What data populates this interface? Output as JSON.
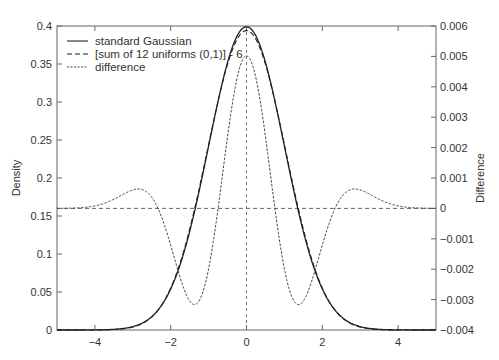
{
  "chart_data": {
    "type": "line",
    "title": "",
    "xlabel": "",
    "ylabel": "Density",
    "y2label": "Difference",
    "xlim": [
      -5,
      5
    ],
    "ylim": [
      0,
      0.4
    ],
    "y2lim": [
      -0.004,
      0.006
    ],
    "grid": false,
    "legend_position": "upper left",
    "x_ticks": [
      -4,
      -2,
      0,
      2,
      4
    ],
    "x_tick_labels": [
      "−4",
      "−2",
      "0",
      "2",
      "4"
    ],
    "y_ticks": [
      0,
      0.05,
      0.1,
      0.15,
      0.2,
      0.25,
      0.3,
      0.35,
      0.4
    ],
    "y_tick_labels": [
      "0",
      "0.05",
      "0.1",
      "0.15",
      "0.2",
      "0.25",
      "0.3",
      "0.35",
      "0.4"
    ],
    "y2_ticks": [
      -0.004,
      -0.003,
      -0.002,
      -0.001,
      0,
      0.001,
      0.002,
      0.003,
      0.004,
      0.005,
      0.006
    ],
    "y2_tick_labels": [
      "−0.004",
      "−0.003",
      "−0.002",
      "−0.001",
      "0",
      "0.001",
      "0.002",
      "0.003",
      "0.004",
      "0.005",
      "0.006"
    ],
    "reference_lines": [
      {
        "orientation": "horizontal",
        "axis": "y2",
        "value": 0,
        "style": "dashed"
      },
      {
        "orientation": "vertical",
        "axis": "x",
        "value": 0,
        "style": "dashed"
      }
    ],
    "x": [
      -5,
      -4,
      -3,
      -2.5,
      -2,
      -1.5,
      -1,
      -0.5,
      0,
      0.5,
      1,
      1.5,
      2,
      2.5,
      3,
      4,
      5
    ],
    "series": [
      {
        "name": "standard Gaussian",
        "axis": "y",
        "style": "solid",
        "values": [
          0.0,
          0.0001,
          0.0044,
          0.0175,
          0.054,
          0.1295,
          0.242,
          0.3521,
          0.3989,
          0.3521,
          0.242,
          0.1295,
          0.054,
          0.0175,
          0.0044,
          0.0001,
          0.0
        ]
      },
      {
        "name": "[sum of 12 uniforms (0,1)] - 6",
        "axis": "y",
        "style": "dashed",
        "values": [
          0.0,
          0.0001,
          0.0042,
          0.0183,
          0.0548,
          0.1266,
          0.2391,
          0.3517,
          0.3939,
          0.3517,
          0.2391,
          0.1266,
          0.0548,
          0.0183,
          0.0042,
          0.0001,
          0.0
        ]
      },
      {
        "name": "difference",
        "axis": "y2",
        "style": "dotted",
        "values": [
          0.0,
          0.0,
          0.0002,
          0.0008,
          0.0008,
          -0.0029,
          -0.0029,
          0.0004,
          0.005,
          0.0004,
          -0.0029,
          -0.0029,
          0.0008,
          0.0008,
          0.0002,
          0.0,
          0.0
        ]
      }
    ],
    "annotations": {
      "difference_peak": {
        "x": 0,
        "value": 0.005
      },
      "difference_minima": [
        {
          "x": -1.15,
          "value": -0.0031
        },
        {
          "x": 1.15,
          "value": -0.0031
        }
      ],
      "difference_maxima": [
        {
          "x": -2.35,
          "value": 0.00085
        },
        {
          "x": 2.35,
          "value": 0.00085
        }
      ]
    }
  },
  "legend": {
    "items": [
      {
        "label": "standard Gaussian",
        "style": "solid"
      },
      {
        "label": "[sum of 12 uniforms (0,1)] - 6",
        "style": "dashed"
      },
      {
        "label": "difference",
        "style": "dotted"
      }
    ]
  },
  "axes": {
    "left_title": "Density",
    "right_title": "Difference"
  },
  "colors": {
    "line": "#222222",
    "axis": "#666666",
    "text": "#333333"
  }
}
